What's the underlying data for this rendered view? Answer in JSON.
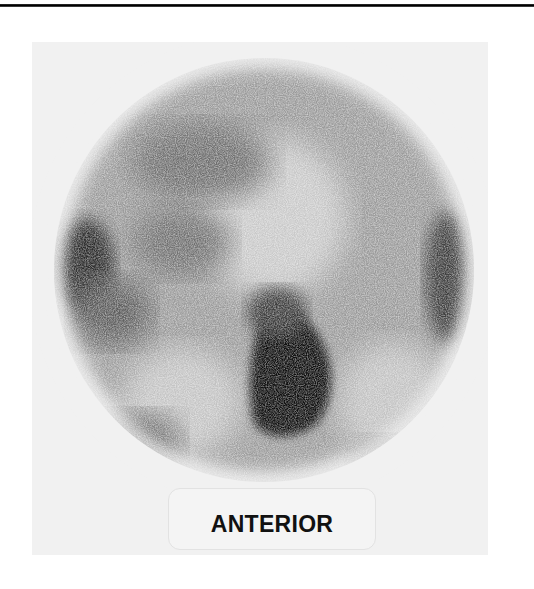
{
  "figure": {
    "type": "scintigraphy-scan",
    "view_label": "ANTERIOR",
    "colors": {
      "background": "#ffffff",
      "frame": "#f1f1f1",
      "activity_dark": "#111111",
      "rule": "#000000"
    }
  }
}
